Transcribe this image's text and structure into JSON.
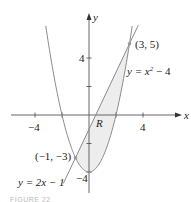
{
  "chart_data": {
    "type": "line",
    "title": "",
    "xlabel": "x",
    "ylabel": "y",
    "xlim": [
      -5.8,
      5.6
    ],
    "ylim": [
      -5.4,
      7.1
    ],
    "grid": false,
    "x_ticks": [
      {
        "value": -4,
        "label": "−4"
      },
      {
        "value": -2,
        "label": ""
      },
      {
        "value": 2,
        "label": ""
      },
      {
        "value": 4,
        "label": "4"
      }
    ],
    "y_ticks": [
      {
        "value": 4,
        "label": "4"
      },
      {
        "value": 2,
        "label": ""
      },
      {
        "value": -2,
        "label": ""
      },
      {
        "value": -4,
        "label": "−4"
      }
    ],
    "series": [
      {
        "name": "y = x² − 4",
        "kind": "parabola",
        "equation": "y = x^2 - 4",
        "x_range": [
          -3.2,
          3.2
        ]
      },
      {
        "name": "y = 2x − 1",
        "kind": "line",
        "equation": "y = 2x - 1",
        "x_range": [
          -1.9,
          3.65
        ]
      }
    ],
    "points": [
      {
        "x": 3,
        "y": 5,
        "label": "(3, 5)"
      },
      {
        "x": -1,
        "y": -3,
        "label": "(−1, −3)"
      }
    ],
    "shaded_region": {
      "label": "R",
      "description": "Region between y = 2x - 1 (above) and y = x^2 - 4 (below) for -1 ≤ x ≤ 3"
    },
    "annotations": [
      {
        "text": "y = x² − 4",
        "near": "right branch of parabola"
      },
      {
        "text": "y = 2x − 1",
        "near": "lower end of line"
      },
      {
        "text": "R",
        "near": "shaded region"
      }
    ]
  },
  "labels": {
    "x_axis": "x",
    "y_axis": "y",
    "x_tick_neg4": "−4",
    "x_tick_4": "4",
    "y_tick_4": "4",
    "y_tick_neg4": "−4",
    "point_a": "(3, 5)",
    "point_b": "(−1, −3)",
    "parabola_eq_prefix": "y = x",
    "parabola_eq_exp": "2",
    "parabola_eq_suffix": " − 4",
    "line_eq": "y = 2x − 1",
    "region": "R",
    "caption": "FIGURE 22"
  },
  "colors": {
    "curve": "#8a8a8a",
    "axis": "#555555",
    "shade": "#ededed",
    "point": "#9a9a9a",
    "text": "#222222"
  }
}
